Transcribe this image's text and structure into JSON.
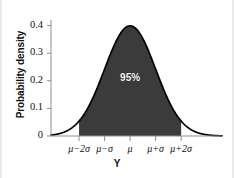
{
  "figure": {
    "background_color": "#ffffff",
    "width": 234,
    "height": 178
  },
  "chart_data": {
    "type": "area",
    "title": "",
    "subtitle": "",
    "xlabel": "Y",
    "ylabel": "Probability density",
    "xlim": [
      -3.1,
      3.6
    ],
    "ylim": [
      0,
      0.42
    ],
    "grid": false,
    "legend": null,
    "curve": {
      "name": "standard normal probability density",
      "distribution": "normal",
      "mean": 0,
      "sd": 1,
      "peak_value": 0.399,
      "line_color": "#000000",
      "line_width": 1.6
    },
    "shaded_region": {
      "label": "95%",
      "from": "mu-2sigma",
      "to": "mu+2sigma",
      "from_x": -2,
      "to_x": 2,
      "area": 0.95,
      "fill_color": "#3b3b3b"
    },
    "annotations": [
      {
        "text": "95%",
        "x": 0,
        "y": 0.21,
        "color": "#f2f2f2"
      }
    ],
    "y_ticks": [
      {
        "value": 0,
        "label": "0"
      },
      {
        "value": 0.1,
        "label": "0.1"
      },
      {
        "value": 0.2,
        "label": "0.2"
      },
      {
        "value": 0.3,
        "label": "0.3"
      },
      {
        "value": 0.4,
        "label": "0.4"
      }
    ],
    "x_ticks": [
      {
        "value": -2,
        "label": "μ−2σ"
      },
      {
        "value": -1,
        "label": "μ−σ"
      },
      {
        "value": 0,
        "label": "μ"
      },
      {
        "value": 1,
        "label": "μ+σ"
      },
      {
        "value": 2,
        "label": "μ+2σ"
      }
    ],
    "x": [
      -3.1,
      -3.0,
      -2.8,
      -2.6,
      -2.4,
      -2.2,
      -2.0,
      -1.8,
      -1.6,
      -1.4,
      -1.2,
      -1.0,
      -0.8,
      -0.6,
      -0.4,
      -0.2,
      0.0,
      0.2,
      0.4,
      0.6,
      0.8,
      1.0,
      1.2,
      1.4,
      1.6,
      1.8,
      2.0,
      2.2,
      2.4,
      2.6,
      2.8,
      3.0,
      3.2,
      3.4,
      3.6
    ],
    "y": [
      0.003,
      0.004,
      0.008,
      0.014,
      0.022,
      0.035,
      0.054,
      0.079,
      0.111,
      0.15,
      0.194,
      0.242,
      0.29,
      0.333,
      0.368,
      0.391,
      0.399,
      0.391,
      0.368,
      0.333,
      0.29,
      0.242,
      0.194,
      0.15,
      0.111,
      0.079,
      0.054,
      0.035,
      0.022,
      0.014,
      0.008,
      0.004,
      0.002,
      0.001,
      0.001
    ]
  }
}
